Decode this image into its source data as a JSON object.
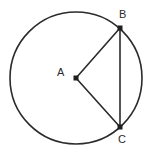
{
  "figure": {
    "kind": "geometry-diagram",
    "background_color": "#ffffff",
    "stroke_color": "#2b2b2b",
    "label_color": "#2b2b2b",
    "canvas": {
      "width": 151,
      "height": 156
    }
  },
  "circle": {
    "name": "circle-A",
    "center_label": "A",
    "center_x": 76,
    "center_y": 78,
    "radius": 66,
    "stroke_width": 1.6,
    "fill": "none"
  },
  "points": [
    {
      "id": "A",
      "label": "A",
      "x": 76,
      "y": 78,
      "role": "center",
      "marker": "square-dot",
      "marker_size": 5
    },
    {
      "id": "B",
      "label": "B",
      "x": 120,
      "y": 28,
      "role": "on-circle",
      "marker": "square-dot",
      "marker_size": 5
    },
    {
      "id": "C",
      "label": "C",
      "x": 120,
      "y": 127,
      "role": "on-circle",
      "marker": "square-dot",
      "marker_size": 5
    }
  ],
  "segments": [
    {
      "id": "AB",
      "from": "A",
      "to": "B",
      "type": "radius",
      "x1": 76,
      "y1": 78,
      "x2": 120,
      "y2": 28,
      "stroke_width": 1.6
    },
    {
      "id": "AC",
      "from": "A",
      "to": "C",
      "type": "radius",
      "x1": 76,
      "y1": 78,
      "x2": 120,
      "y2": 127,
      "stroke_width": 1.6
    },
    {
      "id": "BC",
      "from": "B",
      "to": "C",
      "type": "chord",
      "x1": 120,
      "y1": 28,
      "x2": 120,
      "y2": 127,
      "stroke_width": 1.6
    }
  ],
  "labels": {
    "A": "A",
    "B": "B",
    "C": "C"
  }
}
